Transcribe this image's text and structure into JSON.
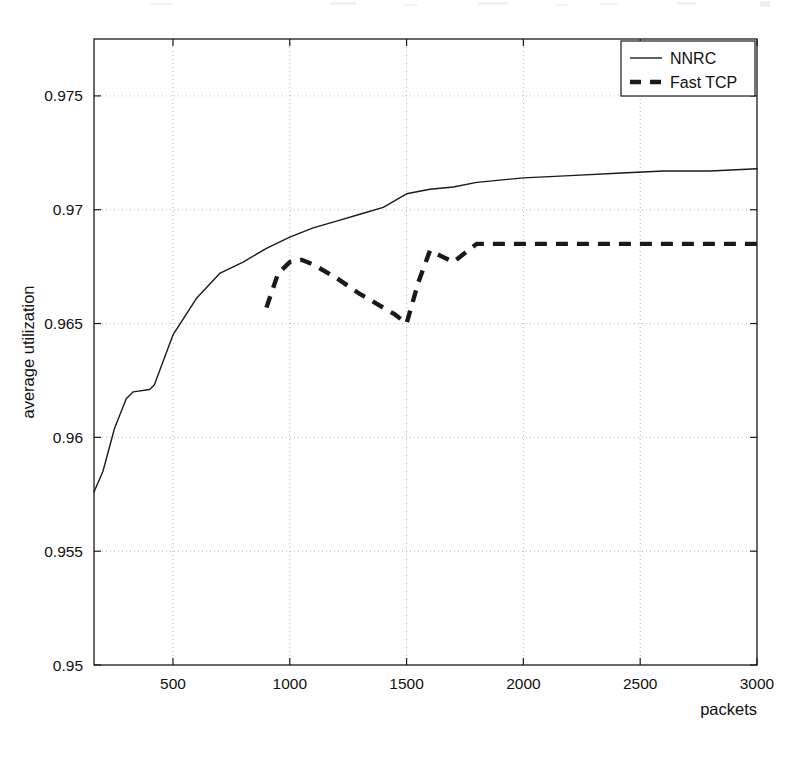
{
  "figure": {
    "title": "",
    "background": "#ffffff",
    "ink_color": "#1a1a1a",
    "grid_color": "#b9b9b9"
  },
  "axes": {
    "x_label": "packets",
    "y_label": "average utilization",
    "x_ticks": [
      "500",
      "1000",
      "1500",
      "2000",
      "2500",
      "3000"
    ],
    "y_ticks": [
      "0.95",
      "0.955",
      "0.96",
      "0.965",
      "0.97",
      "0.975"
    ]
  },
  "legend": {
    "position": "top-right",
    "entries": [
      {
        "label": "NNRC",
        "style": "solid"
      },
      {
        "label": "Fast TCP",
        "style": "dashed"
      }
    ]
  },
  "chart_data": {
    "type": "line",
    "title": "",
    "xlabel": "packets",
    "ylabel": "average utilization",
    "xlim": [
      162,
      3000
    ],
    "ylim": [
      0.95,
      0.9775
    ],
    "xticks": [
      500,
      1000,
      1500,
      2000,
      2500,
      3000
    ],
    "yticks": [
      0.95,
      0.955,
      0.96,
      0.965,
      0.97,
      0.975
    ],
    "grid": true,
    "legend_position": "upper right",
    "series": [
      {
        "name": "NNRC",
        "style": "solid",
        "color": "#1a1a1a",
        "x": [
          162,
          200,
          250,
          300,
          330,
          400,
          420,
          500,
          600,
          700,
          800,
          900,
          1000,
          1100,
          1200,
          1300,
          1400,
          1500,
          1600,
          1700,
          1800,
          1900,
          2000,
          2200,
          2400,
          2600,
          2800,
          3000
        ],
        "y": [
          0.9576,
          0.9585,
          0.9604,
          0.9617,
          0.962,
          0.9621,
          0.9623,
          0.9645,
          0.9661,
          0.9672,
          0.9677,
          0.9683,
          0.9688,
          0.9692,
          0.9695,
          0.9698,
          0.9701,
          0.9707,
          0.9709,
          0.971,
          0.9712,
          0.9713,
          0.9714,
          0.9715,
          0.9716,
          0.9717,
          0.9717,
          0.9718
        ]
      },
      {
        "name": "Fast TCP",
        "style": "dashed",
        "color": "#1a1a1a",
        "x": [
          900,
          950,
          1000,
          1050,
          1100,
          1200,
          1300,
          1400,
          1450,
          1500,
          1550,
          1600,
          1700,
          1800,
          1900,
          2000,
          2200,
          2400,
          2600,
          2800,
          3000
        ],
        "y": [
          0.9657,
          0.9672,
          0.9677,
          0.9678,
          0.9676,
          0.967,
          0.9663,
          0.9657,
          0.9654,
          0.965,
          0.9668,
          0.9682,
          0.9677,
          0.9685,
          0.9685,
          0.9685,
          0.9685,
          0.9685,
          0.9685,
          0.9685,
          0.9685
        ]
      }
    ]
  }
}
